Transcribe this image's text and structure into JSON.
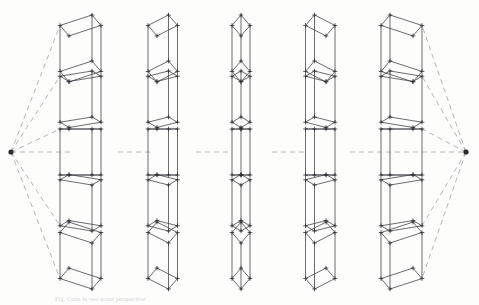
{
  "figure": {
    "caption": "Fig. Cube in two-point perspective",
    "background_color": "#fdfdfc",
    "line_color": "#43434a",
    "construction_line_color": "#8d8d96",
    "vertex_color": "#2b2b30"
  },
  "vanishing_points": [
    {
      "name": "left-vanishing-point",
      "x": 11,
      "y": 152,
      "label": "VP-L"
    },
    {
      "name": "right-vanishing-point",
      "x": 466,
      "y": 152,
      "label": "VP-R"
    }
  ],
  "horizon": {
    "y": 152,
    "visible": false
  },
  "grid": {
    "rows": 5,
    "cols": 5,
    "col_centers": [
      95,
      170,
      241,
      313,
      387
    ],
    "row_centers": [
      38,
      94,
      152,
      208,
      266
    ],
    "cube_size": 46
  },
  "chart_data": {
    "type": "diagram",
    "cells": [
      {
        "row": 0,
        "col": 0,
        "dx": -1.0,
        "dy": 1.0,
        "note": "far left, above eye level"
      },
      {
        "row": 0,
        "col": 1,
        "dx": -0.5,
        "dy": 1.0,
        "note": "above eye level"
      },
      {
        "row": 0,
        "col": 2,
        "dx": 0.0,
        "dy": 1.0,
        "note": "centre, above eye level"
      },
      {
        "row": 0,
        "col": 3,
        "dx": 0.5,
        "dy": 1.0,
        "note": "above eye level"
      },
      {
        "row": 0,
        "col": 4,
        "dx": 1.0,
        "dy": 1.0,
        "note": "far right, above eye level"
      },
      {
        "row": 1,
        "col": 0,
        "dx": -1.0,
        "dy": 0.5,
        "note": "far left, slightly above"
      },
      {
        "row": 1,
        "col": 1,
        "dx": -0.5,
        "dy": 0.5,
        "note": "slightly above"
      },
      {
        "row": 1,
        "col": 2,
        "dx": 0.0,
        "dy": 0.5,
        "note": "centre, slightly above"
      },
      {
        "row": 1,
        "col": 3,
        "dx": 0.5,
        "dy": 0.5,
        "note": "slightly above"
      },
      {
        "row": 1,
        "col": 4,
        "dx": 1.0,
        "dy": 0.5,
        "note": "far right, slightly above"
      },
      {
        "row": 2,
        "col": 0,
        "dx": -1.0,
        "dy": 0.0,
        "note": "far left, on horizon"
      },
      {
        "row": 2,
        "col": 1,
        "dx": -0.5,
        "dy": 0.0,
        "note": "on horizon"
      },
      {
        "row": 2,
        "col": 2,
        "dx": 0.0,
        "dy": 0.0,
        "note": "centre, on horizon, flat square"
      },
      {
        "row": 2,
        "col": 3,
        "dx": 0.5,
        "dy": 0.0,
        "note": "on horizon"
      },
      {
        "row": 2,
        "col": 4,
        "dx": 1.0,
        "dy": 0.0,
        "note": "far right, on horizon"
      },
      {
        "row": 3,
        "col": 0,
        "dx": -1.0,
        "dy": -0.5,
        "note": "far left, slightly below"
      },
      {
        "row": 3,
        "col": 1,
        "dx": -0.5,
        "dy": -0.5,
        "note": "slightly below"
      },
      {
        "row": 3,
        "col": 2,
        "dx": 0.0,
        "dy": -0.5,
        "note": "centre, slightly below"
      },
      {
        "row": 3,
        "col": 3,
        "dx": 0.5,
        "dy": -0.5,
        "note": "slightly below"
      },
      {
        "row": 3,
        "col": 4,
        "dx": 1.0,
        "dy": -0.5,
        "note": "far right, slightly below"
      },
      {
        "row": 4,
        "col": 0,
        "dx": -1.0,
        "dy": -1.0,
        "note": "far left, below eye level"
      },
      {
        "row": 4,
        "col": 1,
        "dx": -0.5,
        "dy": -1.0,
        "note": "below eye level"
      },
      {
        "row": 4,
        "col": 2,
        "dx": 0.0,
        "dy": -1.0,
        "note": "centre, below eye level"
      },
      {
        "row": 4,
        "col": 3,
        "dx": 0.5,
        "dy": -1.0,
        "note": "below eye level"
      },
      {
        "row": 4,
        "col": 4,
        "dx": 1.0,
        "dy": -1.0,
        "note": "far right, below eye level"
      }
    ],
    "construction_rays": {
      "from_left_vp": [
        0,
        1,
        2,
        3,
        4
      ],
      "from_right_vp": [
        0,
        1,
        2,
        3,
        4
      ],
      "style": "dashed"
    }
  }
}
